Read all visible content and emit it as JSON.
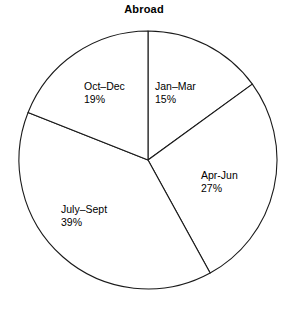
{
  "chart_data": {
    "type": "pie",
    "title": "Abroad",
    "xlabel": "",
    "ylabel": "",
    "categories": [
      "Jan–Mar",
      "Apr-Jun",
      "July–Sept",
      "Oct–Dec"
    ],
    "values": [
      15,
      27,
      39,
      19
    ],
    "value_labels": [
      "15%",
      "27%",
      "39%",
      "19%"
    ],
    "unit": "%",
    "start_angle_deg": 0,
    "direction": "clockwise",
    "legend": "none",
    "grid": false,
    "slices": [
      {
        "label": "Jan–Mar",
        "value": 15,
        "value_label": "15%",
        "start_deg": 0,
        "end_deg": 54,
        "fill": "#ffffff",
        "stroke": "#1a1a1a"
      },
      {
        "label": "Apr-Jun",
        "value": 27,
        "value_label": "27%",
        "start_deg": 54,
        "end_deg": 151.2,
        "fill": "#ffffff",
        "stroke": "#1a1a1a"
      },
      {
        "label": "July–Sept",
        "value": 39,
        "value_label": "39%",
        "start_deg": 151.2,
        "end_deg": 291.6,
        "fill": "#ffffff",
        "stroke": "#1a1a1a"
      },
      {
        "label": "Oct–Dec",
        "value": 19,
        "value_label": "19%",
        "start_deg": 291.6,
        "end_deg": 360,
        "fill": "#ffffff",
        "stroke": "#1a1a1a"
      }
    ]
  },
  "colors": {
    "background": "#ffffff",
    "outline": "#1a1a1a",
    "text": "#000000"
  }
}
